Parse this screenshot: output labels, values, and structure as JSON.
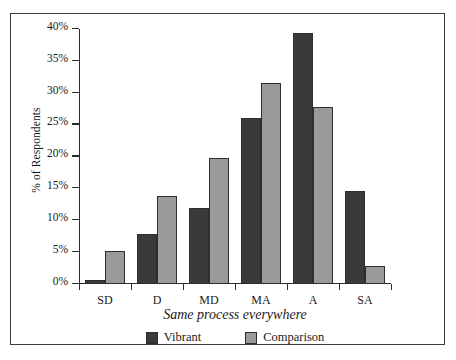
{
  "chart_data": {
    "type": "bar",
    "title": "",
    "subtitle": "",
    "xlabel": "Same process everywhere",
    "ylabel": "% of Respondents",
    "categories": [
      "SD",
      "D",
      "MD",
      "MA",
      "A",
      "SA"
    ],
    "series": [
      {
        "name": "Vibrant",
        "color": "#3a3a3a",
        "values": [
          0.7,
          7.9,
          11.9,
          26.0,
          39.4,
          14.6
        ]
      },
      {
        "name": "Comparison",
        "color": "#9a9a9a",
        "values": [
          5.2,
          13.8,
          19.8,
          31.5,
          27.8,
          2.8
        ]
      }
    ],
    "ylim": [
      0,
      40
    ],
    "ytick_values": [
      0,
      5,
      10,
      15,
      20,
      25,
      30,
      35,
      40
    ],
    "ytick_labels": [
      "0%",
      "5%",
      "10%",
      "15%",
      "20%",
      "25%",
      "30%",
      "35%",
      "40%"
    ],
    "grid": false,
    "legend_position": "bottom",
    "legend_entries": [
      "Vibrant",
      "Comparison"
    ],
    "axis_color": "#2b2b2b",
    "frame_color": "#3b3b3b"
  }
}
